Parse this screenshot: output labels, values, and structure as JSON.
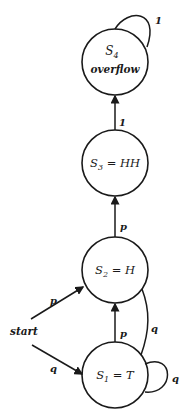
{
  "diagram": {
    "type": "state-machine",
    "colors": {
      "stroke": "#1a1a1a",
      "background": "#ffffff"
    },
    "states": [
      {
        "id": "S4",
        "name": "S",
        "subscript": "4",
        "line2": "overflow"
      },
      {
        "id": "S3",
        "name": "S",
        "subscript": "3",
        "suffix": " = HH"
      },
      {
        "id": "S2",
        "name": "S",
        "subscript": "2",
        "suffix": " = H"
      },
      {
        "id": "S1",
        "name": "S",
        "subscript": "1",
        "suffix": " = T"
      }
    ],
    "start_label": "start",
    "transitions": [
      {
        "from": "S4",
        "to": "S4",
        "label": "1"
      },
      {
        "from": "S3",
        "to": "S4",
        "label": "1"
      },
      {
        "from": "S2",
        "to": "S3",
        "label": "p"
      },
      {
        "from": "S1",
        "to": "S2",
        "label": "p"
      },
      {
        "from": "S2",
        "to": "S1",
        "label": "q"
      },
      {
        "from": "S1",
        "to": "S1",
        "label": "q"
      },
      {
        "from": "start",
        "to": "S2",
        "label": "p"
      },
      {
        "from": "start",
        "to": "S1",
        "label": "q"
      }
    ]
  }
}
